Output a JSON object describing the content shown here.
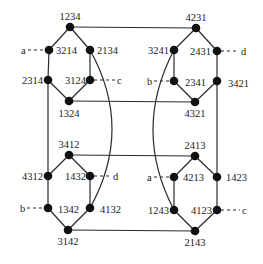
{
  "diagram": {
    "type": "permutation-graph",
    "nodes": [
      {
        "id": "1234",
        "x": 70,
        "y": 27,
        "lx": 70,
        "ly": 20,
        "anchor": "middle"
      },
      {
        "id": "3214",
        "x": 49,
        "y": 50,
        "lx": 56,
        "ly": 54,
        "anchor": "start"
      },
      {
        "id": "2134",
        "x": 90,
        "y": 50,
        "lx": 97,
        "ly": 54,
        "anchor": "start"
      },
      {
        "id": "2314",
        "x": 48,
        "y": 80,
        "lx": 43,
        "ly": 84,
        "anchor": "end"
      },
      {
        "id": "3124",
        "x": 90,
        "y": 80,
        "lx": 86,
        "ly": 84,
        "anchor": "end"
      },
      {
        "id": "1324",
        "x": 69,
        "y": 101,
        "lx": 69,
        "ly": 117,
        "anchor": "middle"
      },
      {
        "id": "4231",
        "x": 196,
        "y": 28,
        "lx": 196,
        "ly": 21,
        "anchor": "middle"
      },
      {
        "id": "3241",
        "x": 174,
        "y": 50,
        "lx": 169,
        "ly": 54,
        "anchor": "end"
      },
      {
        "id": "2431",
        "x": 217,
        "y": 51,
        "lx": 211,
        "ly": 55,
        "anchor": "end"
      },
      {
        "id": "2341",
        "x": 174,
        "y": 81,
        "lx": 185,
        "ly": 86,
        "anchor": "start"
      },
      {
        "id": "3421",
        "x": 217,
        "y": 81,
        "lx": 228,
        "ly": 87,
        "anchor": "start"
      },
      {
        "id": "4321",
        "x": 195,
        "y": 102,
        "lx": 195,
        "ly": 117,
        "anchor": "middle"
      },
      {
        "id": "3412",
        "x": 69,
        "y": 155,
        "lx": 69,
        "ly": 148,
        "anchor": "middle"
      },
      {
        "id": "4312",
        "x": 48,
        "y": 176,
        "lx": 43,
        "ly": 180,
        "anchor": "end"
      },
      {
        "id": "1432",
        "x": 90,
        "y": 176,
        "lx": 86,
        "ly": 180,
        "anchor": "end"
      },
      {
        "id": "1342",
        "x": 48,
        "y": 208,
        "lx": 58,
        "ly": 213,
        "anchor": "start"
      },
      {
        "id": "4132",
        "x": 90,
        "y": 208,
        "lx": 100,
        "ly": 213,
        "anchor": "start"
      },
      {
        "id": "3142",
        "x": 68,
        "y": 230,
        "lx": 68,
        "ly": 245,
        "anchor": "middle"
      },
      {
        "id": "2413",
        "x": 195,
        "y": 156,
        "lx": 195,
        "ly": 149,
        "anchor": "middle"
      },
      {
        "id": "4213",
        "x": 174,
        "y": 177,
        "lx": 183,
        "ly": 181,
        "anchor": "start"
      },
      {
        "id": "1423",
        "x": 217,
        "y": 177,
        "lx": 226,
        "ly": 181,
        "anchor": "start"
      },
      {
        "id": "1243",
        "x": 174,
        "y": 210,
        "lx": 169,
        "ly": 214,
        "anchor": "end"
      },
      {
        "id": "4123",
        "x": 217,
        "y": 210,
        "lx": 212,
        "ly": 214,
        "anchor": "end"
      },
      {
        "id": "2143",
        "x": 195,
        "y": 231,
        "lx": 195,
        "ly": 246,
        "anchor": "middle"
      }
    ],
    "edges": [
      [
        "1234",
        "3214"
      ],
      [
        "1234",
        "2134"
      ],
      [
        "3214",
        "2314"
      ],
      [
        "2134",
        "3124"
      ],
      [
        "2314",
        "1324"
      ],
      [
        "3124",
        "1324"
      ],
      [
        "4231",
        "3241"
      ],
      [
        "4231",
        "2431"
      ],
      [
        "3241",
        "2341"
      ],
      [
        "2431",
        "3421"
      ],
      [
        "2341",
        "4321"
      ],
      [
        "3421",
        "4321"
      ],
      [
        "3412",
        "4312"
      ],
      [
        "3412",
        "1432"
      ],
      [
        "4312",
        "1342"
      ],
      [
        "1432",
        "4132"
      ],
      [
        "1342",
        "3142"
      ],
      [
        "4132",
        "3142"
      ],
      [
        "2413",
        "4213"
      ],
      [
        "2413",
        "1423"
      ],
      [
        "4213",
        "1243"
      ],
      [
        "1423",
        "4123"
      ],
      [
        "1243",
        "2143"
      ],
      [
        "4123",
        "2143"
      ],
      [
        "1234",
        "4231"
      ],
      [
        "1324",
        "4321"
      ],
      [
        "3412",
        "2413"
      ],
      [
        "3142",
        "2143"
      ],
      [
        "2314",
        "4312"
      ],
      [
        "3421",
        "1423"
      ]
    ],
    "curved_edges": [
      {
        "from": "2134",
        "to": "4132",
        "bulge_x": 112,
        "bulge_y": 129
      },
      {
        "from": "3241",
        "to": "1243",
        "bulge_x": 153,
        "bulge_y": 130
      }
    ],
    "markers": [
      {
        "label": "a",
        "node": "3214",
        "side": "left",
        "lx": 21,
        "ly": 54
      },
      {
        "label": "c",
        "node": "3124",
        "side": "right",
        "lx": 117,
        "ly": 84
      },
      {
        "label": "d",
        "node": "2431",
        "side": "right",
        "lx": 241,
        "ly": 55
      },
      {
        "label": "b",
        "node": "2341",
        "side": "left",
        "lx": 147,
        "ly": 85
      },
      {
        "label": "d",
        "node": "1432",
        "side": "right",
        "lx": 113,
        "ly": 180
      },
      {
        "label": "b",
        "node": "1342",
        "side": "left",
        "lx": 20,
        "ly": 212
      },
      {
        "label": "a",
        "node": "4213",
        "side": "left",
        "lx": 147,
        "ly": 181
      },
      {
        "label": "c",
        "node": "4123",
        "side": "right",
        "lx": 242,
        "ly": 214
      }
    ]
  }
}
